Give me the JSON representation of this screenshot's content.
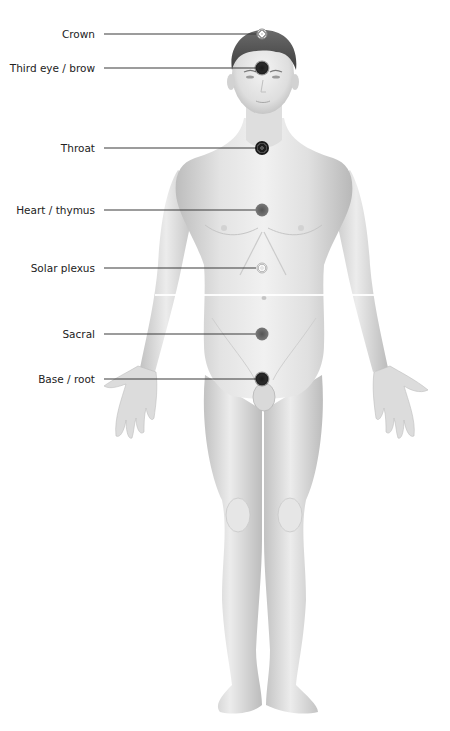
{
  "figure": {
    "colors": {
      "background": "#ffffff",
      "skin_light": "#ededed",
      "skin_mid": "#d6d6d6",
      "skin_shadow": "#b9b9b9",
      "hair": "#5a5a5a",
      "leader_line": "#3a3a3a",
      "label_text": "#222222"
    }
  },
  "chakras": [
    {
      "label": "Crown",
      "y": 34,
      "x": 262,
      "style": "ring"
    },
    {
      "label": "Third eye / brow",
      "y": 68,
      "x": 262,
      "style": "dark"
    },
    {
      "label": "Throat",
      "y": 148,
      "x": 262,
      "style": "spiral"
    },
    {
      "label": "Heart / thymus",
      "y": 210,
      "x": 262,
      "style": "mid"
    },
    {
      "label": "Solar plexus",
      "y": 268,
      "x": 262,
      "style": "ring-light"
    },
    {
      "label": "Sacral",
      "y": 334,
      "x": 262,
      "style": "mid"
    },
    {
      "label": "Base / root",
      "y": 379,
      "x": 262,
      "style": "dark"
    }
  ]
}
